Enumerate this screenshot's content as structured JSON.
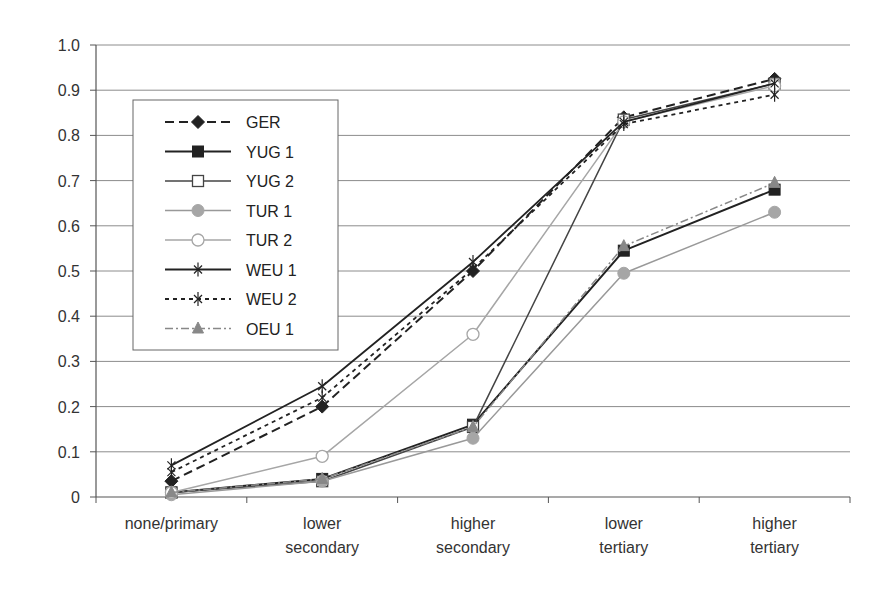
{
  "chart_data": {
    "type": "line",
    "title": "",
    "xlabel": "",
    "ylabel": "",
    "ylim": [
      0,
      1.0
    ],
    "yticks": [
      "0",
      "0.1",
      "0.2",
      "0.3",
      "0.4",
      "0.5",
      "0.6",
      "0.7",
      "0.8",
      "0.9",
      "1.0"
    ],
    "grid": true,
    "legend_position": "upper-left inside",
    "categories": [
      [
        "none/primary"
      ],
      [
        "lower",
        "secondary"
      ],
      [
        "higher",
        "secondary"
      ],
      [
        "lower",
        "tertiary"
      ],
      [
        "higher",
        "tertiary"
      ]
    ],
    "series": [
      {
        "name": "GER",
        "values": [
          0.035,
          0.2,
          0.5,
          0.84,
          0.925
        ],
        "color": "#222222",
        "dash": "9,5",
        "width": 2,
        "marker": "diamond",
        "markerFill": "#222222"
      },
      {
        "name": "YUG 1",
        "values": [
          0.01,
          0.04,
          0.16,
          0.545,
          0.68
        ],
        "color": "#222222",
        "dash": "",
        "width": 2,
        "marker": "square",
        "markerFill": "#222222"
      },
      {
        "name": "YUG 2",
        "values": [
          0.01,
          0.035,
          0.155,
          0.835,
          0.915
        ],
        "color": "#444444",
        "dash": "",
        "width": 1.5,
        "marker": "square-open",
        "markerFill": "#ffffff"
      },
      {
        "name": "TUR 1",
        "values": [
          0.005,
          0.035,
          0.13,
          0.495,
          0.63
        ],
        "color": "#999999",
        "dash": "",
        "width": 1.5,
        "marker": "circle",
        "markerFill": "#a6a6a6"
      },
      {
        "name": "TUR 2",
        "values": [
          0.01,
          0.09,
          0.36,
          0.83,
          0.91
        ],
        "color": "#a6a6a6",
        "dash": "",
        "width": 1.5,
        "marker": "circle-open",
        "markerFill": "#ffffff"
      },
      {
        "name": "WEU 1",
        "values": [
          0.07,
          0.245,
          0.52,
          0.83,
          0.915
        ],
        "color": "#222222",
        "dash": "",
        "width": 1.8,
        "marker": "asterisk",
        "markerFill": "#222222"
      },
      {
        "name": "WEU 2",
        "values": [
          0.055,
          0.22,
          0.505,
          0.825,
          0.89
        ],
        "color": "#222222",
        "dash": "4,4",
        "width": 1.8,
        "marker": "asterisk",
        "markerFill": "#222222"
      },
      {
        "name": "OEU 1",
        "values": [
          0.01,
          0.04,
          0.155,
          0.555,
          0.695
        ],
        "color": "#888888",
        "dash": "8,3,2,3",
        "width": 1.5,
        "marker": "triangle",
        "markerFill": "#888888"
      }
    ]
  }
}
